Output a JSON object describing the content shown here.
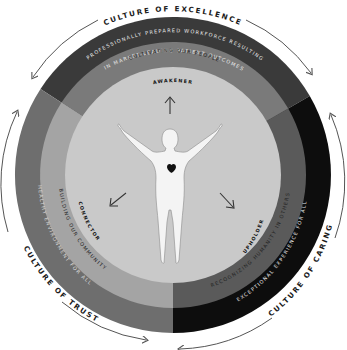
{
  "diagram": {
    "center": {
      "x": 173,
      "y": 175
    },
    "radii": {
      "outer": 158,
      "middle": 133,
      "inner": 108
    },
    "colors": {
      "background": "#ffffff",
      "inner_disc": "#c9c9c9",
      "top_outer": "#3a3a3a",
      "top_middle": "#7a7a7a",
      "left_outer": "#6e6e6e",
      "left_middle": "#a4a4a4",
      "right_outer": "#0d0d0d",
      "right_middle": "#5a5a5a",
      "figure": "#f4f4f4",
      "heart": "#111111",
      "arrow": "#555555"
    },
    "cultures": [
      {
        "id": "excellence",
        "label": "CULTURE OF EXCELLENCE"
      },
      {
        "id": "caring",
        "label": "CULTURE OF CARING"
      },
      {
        "id": "trust",
        "label": "CULTURE OF TRUST"
      }
    ],
    "outcome_bands": [
      {
        "id": "top",
        "line1": "PROFESSIONALLY PREPARED WORKFORCE RESULTING",
        "line2": "IN MARKET-LEADING PATIENT OUTCOMES"
      },
      {
        "id": "right",
        "line1": "EXCEPTIONAL EXPERIENCE FOR ALL"
      },
      {
        "id": "left",
        "line1": "HEALTHY ENVIRONMENT FOR ALL"
      }
    ],
    "practice_bands": [
      {
        "id": "top",
        "label": "CULTIVATING OUR PEOPLE"
      },
      {
        "id": "right",
        "label": "RECOGNIZING HUMANITY IN OTHERS"
      },
      {
        "id": "left",
        "label": "BUILDING OUR COMMUNITY"
      }
    ],
    "roles": [
      {
        "id": "awakener",
        "label": "AWAKENER",
        "arrow": "up"
      },
      {
        "id": "upholder",
        "label": "UPHOLDER",
        "arrow": "down-right"
      },
      {
        "id": "connector",
        "label": "CONNECTOR",
        "arrow": "down-left"
      }
    ],
    "center_figure": {
      "icon": "person-with-heart-icon"
    }
  }
}
